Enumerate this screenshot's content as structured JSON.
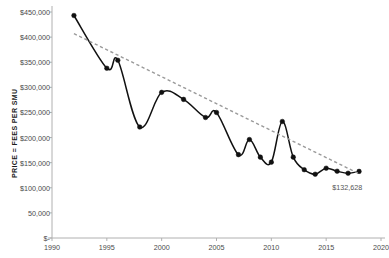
{
  "chart_data": {
    "type": "line",
    "title": "",
    "xlabel": "",
    "ylabel": "PRICE = FEES PER SMU",
    "xlim": [
      1990,
      2020
    ],
    "ylim": [
      0,
      450000
    ],
    "grid": false,
    "legend": "none",
    "x_ticks": [
      "1990",
      "1995",
      "2000",
      "2005",
      "2010",
      "2015",
      "2020"
    ],
    "x_tick_values": [
      1990,
      1995,
      2000,
      2005,
      2010,
      2015,
      2020
    ],
    "y_ticks": [
      "$-",
      "50,000",
      "$100,000",
      "$150,000",
      "$200,000",
      "$250,000",
      "$300,000",
      "$350,000",
      "$400,000",
      "$450,000"
    ],
    "y_tick_values": [
      0,
      50000,
      100000,
      150000,
      200000,
      250000,
      300000,
      350000,
      400000,
      450000
    ],
    "series": [
      {
        "name": "Price = Fees per SMU",
        "style": "solid-with-markers",
        "color": "#111111",
        "x": [
          1992,
          1995,
          1996,
          1998,
          2000,
          2002,
          2004,
          2005,
          2007,
          2008,
          2009,
          2010,
          2011,
          2012,
          2013,
          2014,
          2015,
          2016,
          2017,
          2018
        ],
        "values": [
          443000,
          338000,
          354000,
          221000,
          290000,
          276000,
          240000,
          250000,
          166000,
          196000,
          161000,
          151000,
          232000,
          161000,
          136000,
          127000,
          139000,
          133000,
          129000,
          132628
        ]
      },
      {
        "name": "Trendline",
        "style": "dashed",
        "color": "#9a9a9a",
        "x": [
          1992,
          2018
        ],
        "values": [
          407000,
          128000
        ]
      }
    ],
    "annotations": [
      {
        "text": "$132,628",
        "x": 2017.2,
        "y": 100000
      }
    ]
  }
}
